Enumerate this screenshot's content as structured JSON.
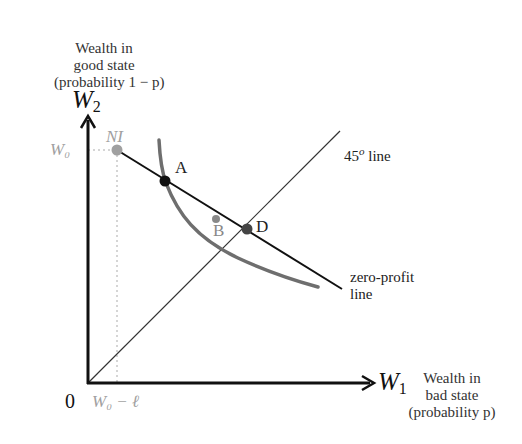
{
  "diagram": {
    "title": "",
    "y_axis": {
      "symbol": "W",
      "subscript": "2",
      "description_lines": [
        "Wealth in",
        "good state",
        "(probability 1 − p)"
      ]
    },
    "x_axis": {
      "symbol": "W",
      "subscript": "1",
      "description_lines": [
        "Wealth in",
        "bad state",
        "(probability p)"
      ]
    },
    "origin_label": "0",
    "tick_labels": {
      "y_tick": "W₀",
      "x_tick": "W₀ − ℓ"
    },
    "points": [
      {
        "id": "NI",
        "label": "NI",
        "color": "#a0a0a0"
      },
      {
        "id": "A",
        "label": "A",
        "color": "#111111"
      },
      {
        "id": "B",
        "label": "B",
        "color": "#888888"
      },
      {
        "id": "D",
        "label": "D",
        "color": "#444444"
      }
    ],
    "lines": {
      "forty_five": {
        "label_base": "45",
        "label_sup": "o",
        "label_rest": " line"
      },
      "zero_profit": {
        "label_lines": [
          "zero-profit",
          "line"
        ]
      }
    },
    "colors": {
      "axis": "#111111",
      "zero_profit_line": "#111111",
      "indifference_curve": "#6e6e6e",
      "forty_five_line": "#333333",
      "guide_dotted": "#c8c8c8"
    }
  }
}
